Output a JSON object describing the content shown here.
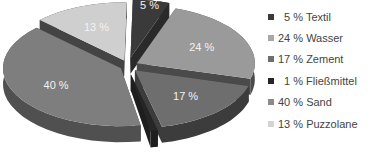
{
  "chart_data": {
    "type": "pie",
    "style": "3d-exploded",
    "title": "",
    "categories": [
      "Textil",
      "Wasser",
      "Zement",
      "Fließmittel",
      "Sand",
      "Puzzolane"
    ],
    "values": [
      5,
      24,
      17,
      1,
      40,
      13
    ],
    "unit": "%",
    "slice_labels": [
      "5 %",
      "24 %",
      "17 %",
      "",
      "40 %",
      "13 %"
    ],
    "colors": [
      "#3a3a3a",
      "#9a9a9a",
      "#6e6e6e",
      "#262626",
      "#7e7e7e",
      "#cfcfcf"
    ],
    "side_colors": [
      "#2a2a2a",
      "#4a4a4a",
      "#3c3c3c",
      "#1e1e1e",
      "#505050",
      "#444444"
    ],
    "legend_position": "right"
  },
  "legend": {
    "items": [
      {
        "label": "  5 % Textil",
        "color": "#3a3a3a"
      },
      {
        "label": "24 % Wasser",
        "color": "#a8a8a8"
      },
      {
        "label": "17 % Zement",
        "color": "#6e6e6e"
      },
      {
        "label": "  1 % Fließmittel",
        "color": "#262626"
      },
      {
        "label": "40 % Sand",
        "color": "#8a8a8a"
      },
      {
        "label": "13 % Puzzolane",
        "color": "#d4d4d4"
      }
    ]
  }
}
